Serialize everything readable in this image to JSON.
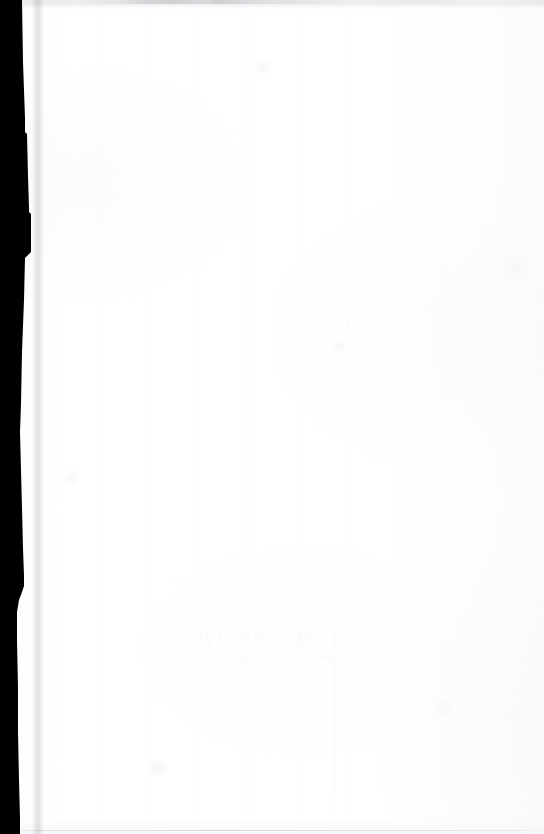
{
  "document": {
    "kind": "scanned-page",
    "page_state": "blank",
    "width": 544,
    "height": 834,
    "visible_text": "",
    "notes_label": ""
  },
  "colors": {
    "paper": "#ffffff",
    "paper_tint": "#fdfdfd",
    "scanner_bed": "#000000",
    "top_band": "#e8e8eb",
    "top_band_dark": "#cfcfd4",
    "bottom_rule": "#d4d4da",
    "showthrough_ink": "#fbfbfc"
  },
  "regions": {
    "scanner_bed_margin": {
      "label": "",
      "edge": "irregular-stepped"
    },
    "top_edge_band": {
      "label": ""
    },
    "bottom_edge_rule": {
      "label": ""
    },
    "show_through": {
      "label": "",
      "text": ""
    }
  },
  "show_through_marks": [
    {
      "x": 2,
      "y": 6,
      "w": 3,
      "h": 14,
      "r": -8
    },
    {
      "x": 7,
      "y": 4,
      "w": 2,
      "h": 16,
      "r": 4
    },
    {
      "x": 11,
      "y": 10,
      "w": 6,
      "h": 3,
      "r": -6
    },
    {
      "x": 10,
      "y": 16,
      "w": 4,
      "h": 8,
      "r": 10
    },
    {
      "x": 22,
      "y": 2,
      "w": 2,
      "h": 18,
      "r": -4
    },
    {
      "x": 28,
      "y": 8,
      "w": 10,
      "h": 3,
      "r": -5
    },
    {
      "x": 33,
      "y": 5,
      "w": 2,
      "h": 13,
      "r": 6
    },
    {
      "x": 40,
      "y": 9,
      "w": 8,
      "h": 3,
      "r": -3
    },
    {
      "x": 47,
      "y": 6,
      "w": 2,
      "h": 12,
      "r": 5
    },
    {
      "x": 57,
      "y": 3,
      "w": 3,
      "h": 16,
      "r": -7
    },
    {
      "x": 62,
      "y": 12,
      "w": 5,
      "h": 3,
      "r": 2
    },
    {
      "x": 74,
      "y": 14,
      "w": 4,
      "h": 4,
      "r": 0
    },
    {
      "x": 86,
      "y": 4,
      "w": 2,
      "h": 15,
      "r": -5
    },
    {
      "x": 91,
      "y": 7,
      "w": 6,
      "h": 3,
      "r": -8
    },
    {
      "x": 100,
      "y": 2,
      "w": 3,
      "h": 17,
      "r": 7
    },
    {
      "x": 106,
      "y": 9,
      "w": 5,
      "h": 3,
      "r": -4
    },
    {
      "x": 113,
      "y": 5,
      "w": 2,
      "h": 14,
      "r": 3
    },
    {
      "x": 20,
      "y": 26,
      "w": 4,
      "h": 5,
      "r": -10
    },
    {
      "x": 26,
      "y": 30,
      "w": 3,
      "h": 3,
      "r": 0
    },
    {
      "x": 42,
      "y": 24,
      "w": 3,
      "h": 12,
      "r": 8
    },
    {
      "x": 46,
      "y": 33,
      "w": 5,
      "h": 3,
      "r": -6
    },
    {
      "x": 66,
      "y": 28,
      "w": 4,
      "h": 4,
      "r": 0
    },
    {
      "x": 80,
      "y": 31,
      "w": 3,
      "h": 3,
      "r": 0
    },
    {
      "x": 118,
      "y": 22,
      "w": 3,
      "h": 12,
      "r": -6
    },
    {
      "x": 122,
      "y": 30,
      "w": 7,
      "h": 3,
      "r": 4
    },
    {
      "x": 131,
      "y": 34,
      "w": 4,
      "h": 4,
      "r": 0
    },
    {
      "x": 137,
      "y": 38,
      "w": 3,
      "h": 3,
      "r": 0
    }
  ],
  "smudges": [
    {
      "x": 250,
      "y": 60,
      "w": 26,
      "h": 14
    },
    {
      "x": 500,
      "y": 250,
      "w": 30,
      "h": 40
    },
    {
      "x": 60,
      "y": 470,
      "w": 22,
      "h": 16
    },
    {
      "x": 330,
      "y": 340,
      "w": 18,
      "h": 12
    },
    {
      "x": 430,
      "y": 700,
      "w": 26,
      "h": 18
    },
    {
      "x": 140,
      "y": 760,
      "w": 34,
      "h": 16
    }
  ]
}
